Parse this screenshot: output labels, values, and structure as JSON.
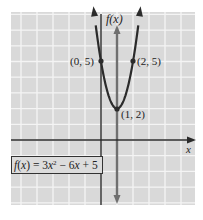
{
  "chart_data": {
    "type": "line",
    "title": "",
    "function": "f(x) = 3x^2 - 6x + 5",
    "xlabel": "x",
    "ylabel": "f(x)",
    "xlim": [
      -5.7,
      5.9
    ],
    "ylim": [
      -4.2,
      8.1
    ],
    "grid": true,
    "grid_step": 1,
    "series": [
      {
        "name": "f(x) = 3x^2 - 6x + 5",
        "x": [
          -0.414,
          0,
          0.25,
          0.5,
          0.75,
          1,
          1.25,
          1.5,
          1.75,
          2,
          2.414
        ],
        "y": [
          8,
          5,
          3.6875,
          2.75,
          2.1875,
          2,
          2.1875,
          2.75,
          3.6875,
          5,
          8
        ]
      }
    ],
    "annotations": [
      {
        "label": "(0, 5)",
        "x": 0,
        "y": 5
      },
      {
        "label": "(2, 5)",
        "x": 2,
        "y": 5
      },
      {
        "label": "(1, 2)",
        "x": 1,
        "y": 2
      }
    ],
    "axis_of_symmetry": {
      "x": 1
    },
    "legend": {
      "text": "f(x) = 3x² − 6x + 5",
      "position": "lower-left"
    }
  },
  "labels": {
    "y_axis": "f(x)",
    "x_axis": "x",
    "point_0_5": "(0, 5)",
    "point_2_5": "(2, 5)",
    "point_1_2": "(1, 2)"
  },
  "formula": {
    "f": "f",
    "paren_open": "(",
    "var": "x",
    "paren_close": ")",
    "eq": " = 3",
    "var2": "x",
    "exp": "2",
    "minus": " − 6",
    "var3": "x",
    "plus": " + 5"
  },
  "colors": {
    "grid_bg": "#d9d9d9",
    "grid_line": "#f4f4f4",
    "axis": "#2a2a2a",
    "curve": "#2b2b2b",
    "symmetry_line": "#6f6f6f"
  }
}
